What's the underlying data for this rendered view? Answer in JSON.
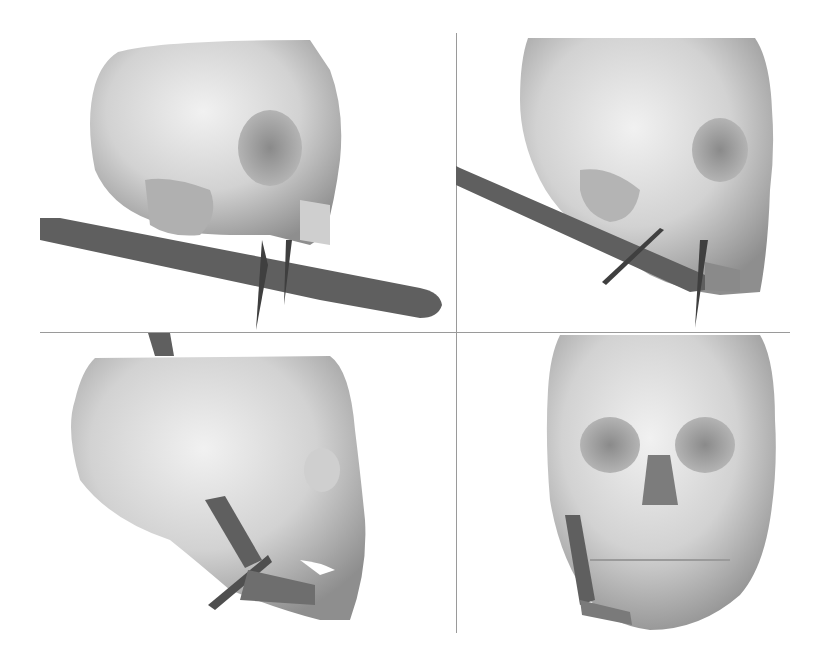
{
  "figure": {
    "layout": "2x2 grid",
    "panels": [
      {
        "position": "top-left",
        "view": "oblique-left-lateral skull render",
        "plate_shape": "long bar across lower jaw with two vertical spikes"
      },
      {
        "position": "top-right",
        "view": "right oblique skull render",
        "plate_shape": "diagonal bar crossing jaw with cross marker"
      },
      {
        "position": "bottom-left",
        "view": "right lateral skull render",
        "plate_shape": "L-shaped mandible plate with cross marker"
      },
      {
        "position": "bottom-right",
        "view": "frontal skull render",
        "plate_shape": "U-shaped mandible plate on left ramus"
      }
    ],
    "colors": {
      "background": "#ffffff",
      "bone_light": "#e4e4e4",
      "bone_mid": "#bdbdbd",
      "bone_dark": "#7c7c7c",
      "plate": "#5d5d5d",
      "divider": "#9a9a9a"
    }
  }
}
